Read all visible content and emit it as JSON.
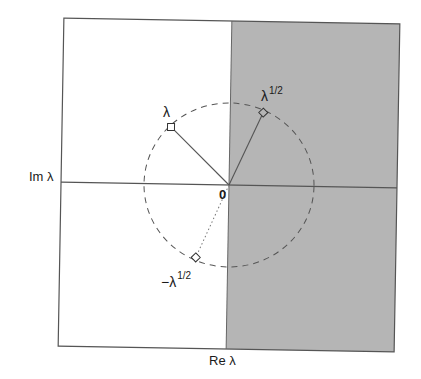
{
  "diagram": {
    "type": "complex-plane-square-root",
    "axis_labels": {
      "horizontal": "Re λ",
      "vertical": "Im λ",
      "origin": "0"
    },
    "points": [
      {
        "id": "lambda",
        "label": "λ",
        "superscript": "",
        "marker": "square"
      },
      {
        "id": "sqrt-lambda",
        "label": "λ",
        "superscript": "1/2",
        "marker": "diamond"
      },
      {
        "id": "neg-sqrt-lambda",
        "label": "−λ",
        "superscript": "1/2",
        "marker": "diamond"
      }
    ],
    "regions": {
      "shaded": "right half-plane (Re > 0)",
      "shade_color": "#b5b5b5"
    },
    "circle": {
      "style": "dashed"
    },
    "colors": {
      "frame": "#555555",
      "axis": "#666666",
      "segment": "#555555",
      "text": "#1a1a1a"
    }
  }
}
